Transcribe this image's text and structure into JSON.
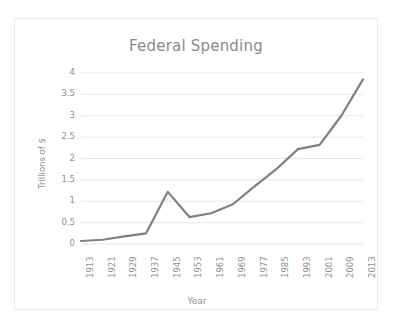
{
  "chart_data": {
    "type": "line",
    "title": "Federal Spending",
    "xlabel": "Year",
    "ylabel": "Trillions of $",
    "categories": [
      "1913",
      "1921",
      "1929",
      "1937",
      "1945",
      "1953",
      "1961",
      "1969",
      "1977",
      "1985",
      "1993",
      "2001",
      "2009",
      "2013"
    ],
    "values": [
      0.07,
      0.1,
      0.18,
      0.25,
      1.22,
      0.63,
      0.72,
      0.93,
      1.35,
      1.75,
      2.22,
      2.32,
      3.0,
      3.85
    ],
    "ylim": [
      0,
      4
    ],
    "yticks": [
      "0",
      "0.5",
      "1",
      "1.5",
      "2",
      "2.5",
      "3",
      "3.5",
      "4"
    ],
    "ytick_values": [
      0,
      0.5,
      1,
      1.5,
      2,
      2.5,
      3,
      3.5,
      4
    ],
    "grid": true,
    "legend": false,
    "series_color": "#808080",
    "grid_color": "#e4e4e4",
    "text_color": "#8f8f8f"
  }
}
